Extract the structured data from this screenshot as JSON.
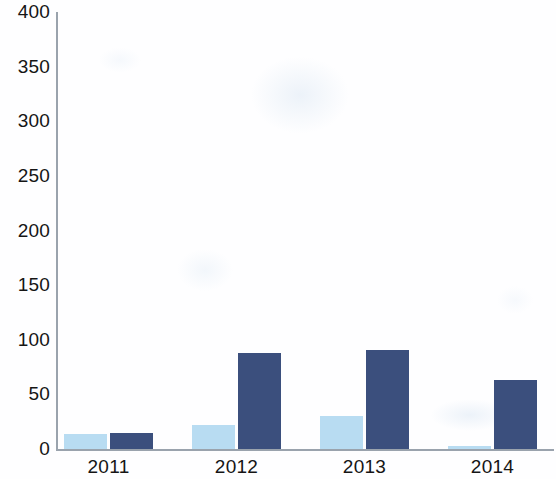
{
  "chart_data": {
    "type": "bar",
    "title": "",
    "subtitle": "",
    "xlabel": "",
    "ylabel": "",
    "categories": [
      "2011",
      "2012",
      "2013",
      "2014"
    ],
    "series": [
      {
        "name": "Series 1",
        "color": "#b8dcf2",
        "values": [
          14,
          22,
          30,
          3
        ]
      },
      {
        "name": "Series 2",
        "color": "#3b4f7d",
        "values": [
          15,
          88,
          91,
          63
        ]
      }
    ],
    "ylim": [
      0,
      400
    ],
    "yticks": [
      0,
      50,
      100,
      150,
      200,
      250,
      300,
      350,
      400
    ],
    "ytick_labels": [
      "0",
      "50",
      "100",
      "150",
      "200",
      "250",
      "300",
      "350",
      "400"
    ],
    "grid": false,
    "legend": "none",
    "axis_color": "#9aa3ad",
    "background": "#ffffff"
  },
  "axes": {
    "y_axis_name": "value-axis",
    "x_axis_name": "year-axis"
  }
}
